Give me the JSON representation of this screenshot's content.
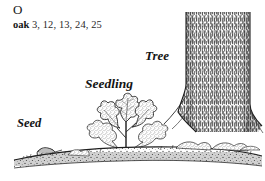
{
  "page": {
    "background_color": "#ffffff",
    "ink_color": "#1a1a1a",
    "width": 265,
    "height": 181
  },
  "index": {
    "letter_heading": "O",
    "entry": {
      "term": "oak",
      "page_numbers": "3, 12, 13, 24, 25"
    }
  },
  "illustration": {
    "description": "Pen-and-ink engraving of oak growth stages from left to right along a ground line",
    "labels": [
      {
        "id": "seed",
        "text": "Seed"
      },
      {
        "id": "seedling",
        "text": "Seedling"
      },
      {
        "id": "tree",
        "text": "Tree"
      }
    ],
    "elements": {
      "acorn": "acorn-seed-on-ground",
      "sprout": "oak-seedling-with-lobed-leaves",
      "trunk": "mature-oak-trunk-vertical-hatching",
      "ground": "textured-ground-line-with-leaf-litter"
    }
  }
}
